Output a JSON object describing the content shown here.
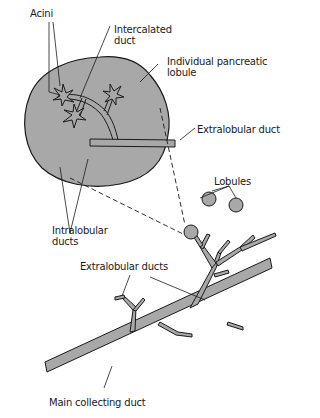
{
  "diagram": {
    "labels": {
      "acini": "Acini",
      "intercalated_duct_1": "Intercalated",
      "intercalated_duct_2": "duct",
      "lobule_1": "Individual pancreatic",
      "lobule_2": "lobule",
      "extralobular_duct": "Extralobular duct",
      "lobules": "Lobules",
      "intralobular_1": "Intralobular",
      "intralobular_2": "ducts",
      "extralobular_ducts": "Extralobular ducts",
      "main_collecting_duct": "Main collecting duct"
    },
    "colors": {
      "fill": "#a8a8a8",
      "stroke": "#1a1a1a",
      "background": "#ffffff"
    }
  }
}
